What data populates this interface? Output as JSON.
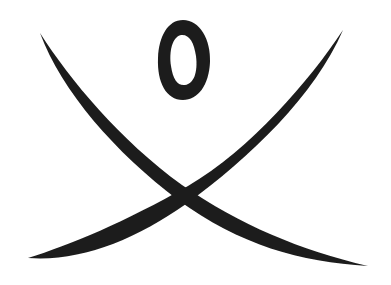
{
  "figure": {
    "description": "Symbol of two crossing curved brush strokes with an oval above",
    "ink_color": "#1c1c1c",
    "background_color": "#ffffff",
    "elements": [
      {
        "name": "oval",
        "shape": "ellipse"
      },
      {
        "name": "stroke-left-to-right",
        "shape": "curved-brush-stroke"
      },
      {
        "name": "stroke-right-to-left",
        "shape": "curved-brush-stroke"
      }
    ]
  }
}
